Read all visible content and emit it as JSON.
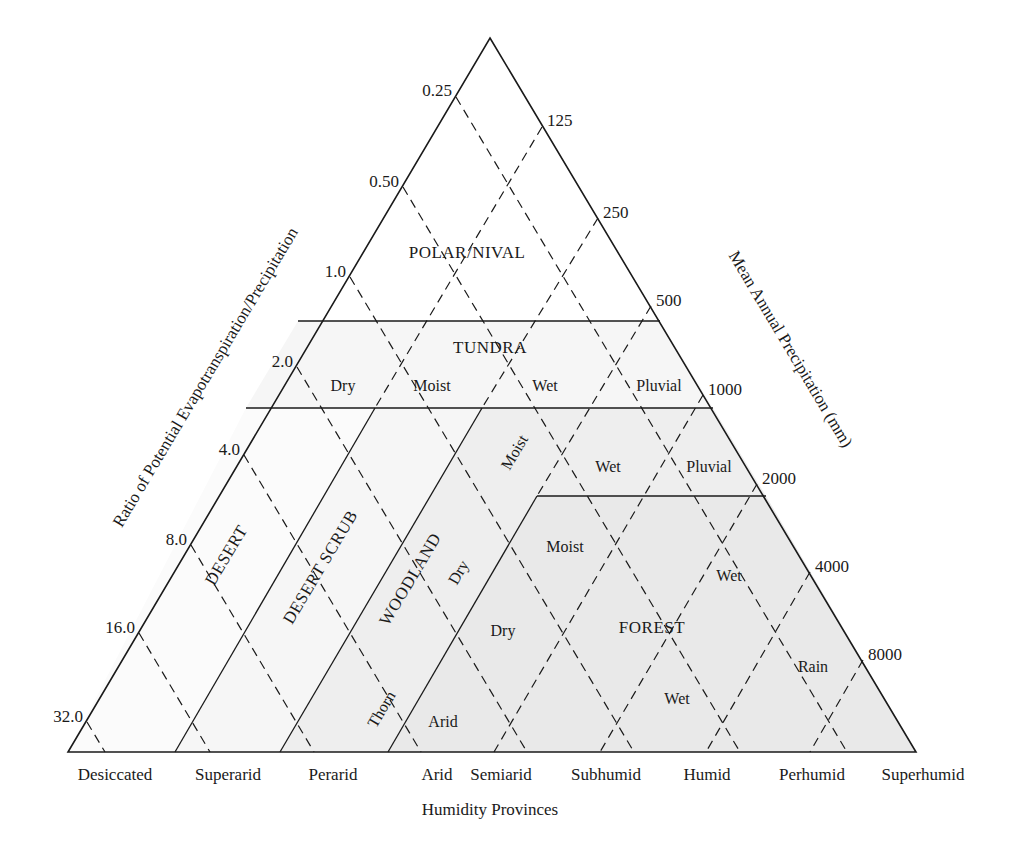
{
  "diagram": {
    "colors": {
      "line": "#1a1a1a",
      "fill_light": "#f6f6f6",
      "fill_mid": "#eeeeee",
      "fill_dark": "#e9e9e9"
    },
    "left_axis": {
      "title": "Ratio of Potential Evapotranspiration/Precipitation",
      "ticks": [
        "0.25",
        "0.50",
        "1.0",
        "2.0",
        "4.0",
        "8.0",
        "16.0",
        "32.0"
      ]
    },
    "right_axis": {
      "title": "Mean Annual Precipitation (mm)",
      "ticks": [
        "125",
        "250",
        "500",
        "1000",
        "2000",
        "4000",
        "8000"
      ]
    },
    "base_axis": {
      "title": "Humidity Provinces",
      "labels": [
        "Desiccated",
        "Superarid",
        "Perarid",
        "Arid",
        "Semiarid",
        "Subhumid",
        "Humid",
        "Perhumid",
        "Superhumid"
      ]
    },
    "regions": {
      "polar": "POLAR/NIVAL",
      "tundra": {
        "name": "TUNDRA",
        "zones": [
          "Dry",
          "Moist",
          "Wet",
          "Pluvial"
        ]
      },
      "desert": "DESERT",
      "desert_scrub": "DESERT SCRUB",
      "woodland": {
        "name": "WOODLAND",
        "zones": [
          "Thorn",
          "Dry",
          "Moist",
          "Wet",
          "Pluvial"
        ]
      },
      "forest": {
        "name": "FOREST",
        "zones": [
          "Arid",
          "Dry",
          "Moist",
          "Wet",
          "Wet",
          "Rain"
        ]
      }
    }
  }
}
